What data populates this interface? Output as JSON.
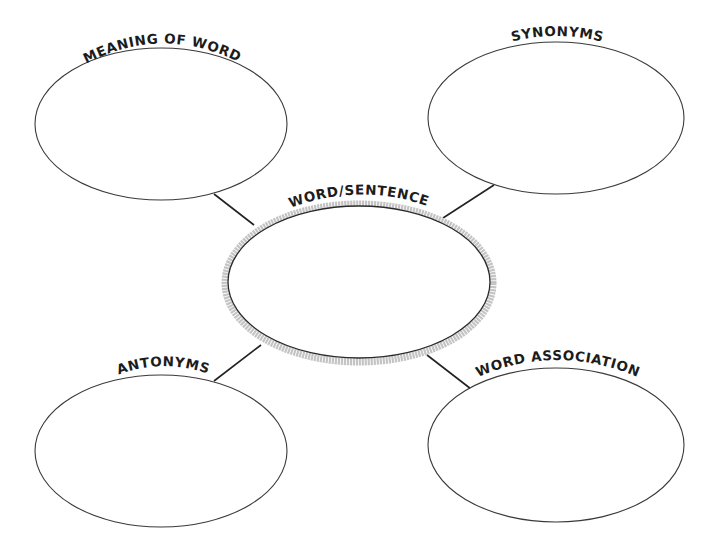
{
  "diagram": {
    "type": "word-map graphic organizer",
    "center": {
      "label": "WORD/SENTENCE",
      "content": ""
    },
    "bubbles": [
      {
        "position": "top-left",
        "label": "MEANING OF WORD",
        "content": ""
      },
      {
        "position": "top-right",
        "label": "SYNONYMS",
        "content": ""
      },
      {
        "position": "bottom-left",
        "label": "ANTONYMS",
        "content": ""
      },
      {
        "position": "bottom-right",
        "label": "WORD ASSOCIATION",
        "content": ""
      }
    ],
    "colors": {
      "background": "#ffffff",
      "outline": "#3a3a3a",
      "center_band": "#c4c4c4",
      "text": "#1c1c1c"
    }
  }
}
